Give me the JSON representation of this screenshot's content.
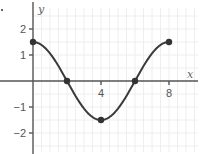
{
  "chart_data": {
    "type": "line",
    "title": "",
    "xlabel": "x",
    "ylabel": "y",
    "xlim": [
      0,
      9.6
    ],
    "ylim": [
      -2.8,
      3.0
    ],
    "grid": true,
    "x_ticks": [
      4,
      8
    ],
    "x_tick_labels": [
      "4",
      "8"
    ],
    "y_ticks": [
      2,
      1,
      -1,
      -2
    ],
    "y_tick_labels": [
      "2",
      "1",
      "−1",
      "−2"
    ],
    "series": [
      {
        "name": "curve",
        "function": "y = 1.5 cos(pi x / 4)",
        "x": [
          0,
          2,
          4,
          6,
          8
        ],
        "y": [
          1.5,
          0,
          -1.5,
          0,
          1.5
        ]
      }
    ],
    "marked_points": [
      {
        "x": 0,
        "y": 1.5
      },
      {
        "x": 2,
        "y": 0
      },
      {
        "x": 4,
        "y": -1.5
      },
      {
        "x": 6,
        "y": 0
      },
      {
        "x": 8,
        "y": 1.5
      }
    ],
    "colors": {
      "curve": "#3a3a3a",
      "axis": "#555555",
      "grid": "#eeeeee"
    }
  }
}
